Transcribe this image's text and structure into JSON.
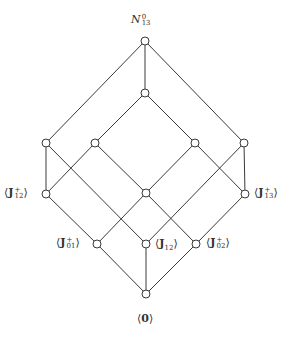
{
  "diagram": {
    "type": "lattice (Hasse diagram)",
    "nodes": [
      {
        "id": "top",
        "x": 145,
        "y": 41,
        "label": "N",
        "label_sub": "13",
        "label_sup": "0",
        "label_style": "calligraphic"
      },
      {
        "id": "n2",
        "x": 145,
        "y": 93,
        "label": ""
      },
      {
        "id": "l1",
        "x": 46,
        "y": 143,
        "label": ""
      },
      {
        "id": "l2",
        "x": 95,
        "y": 143,
        "label": ""
      },
      {
        "id": "r2",
        "x": 195,
        "y": 143,
        "label": ""
      },
      {
        "id": "r1",
        "x": 244,
        "y": 143,
        "label": ""
      },
      {
        "id": "J12p",
        "x": 46,
        "y": 194,
        "label": "J",
        "label_sub": "12",
        "label_sup": "+"
      },
      {
        "id": "mid",
        "x": 146,
        "y": 193,
        "label": ""
      },
      {
        "id": "J13p",
        "x": 245,
        "y": 194,
        "label": "J",
        "label_sub": "13",
        "label_sup": "+"
      },
      {
        "id": "J01p",
        "x": 97,
        "y": 244,
        "label": "J",
        "label_sub": "01",
        "label_sup": "+"
      },
      {
        "id": "J12",
        "x": 146,
        "y": 244,
        "label": "J",
        "label_sub": "12",
        "label_sup": ""
      },
      {
        "id": "J02p",
        "x": 196,
        "y": 244,
        "label": "J",
        "label_sub": "02",
        "label_sup": "+"
      },
      {
        "id": "zero",
        "x": 146,
        "y": 294,
        "label": "0"
      }
    ],
    "edges": [
      [
        "top",
        "l1"
      ],
      [
        "top",
        "n2"
      ],
      [
        "top",
        "r1"
      ],
      [
        "n2",
        "l2"
      ],
      [
        "n2",
        "r2"
      ],
      [
        "l1",
        "J12p"
      ],
      [
        "l1",
        "J12"
      ],
      [
        "l2",
        "J12p"
      ],
      [
        "l2",
        "mid"
      ],
      [
        "r2",
        "J13p"
      ],
      [
        "r2",
        "mid"
      ],
      [
        "r1",
        "J13p"
      ],
      [
        "r1",
        "J12"
      ],
      [
        "J12p",
        "J01p"
      ],
      [
        "mid",
        "J01p"
      ],
      [
        "mid",
        "J02p"
      ],
      [
        "J13p",
        "J02p"
      ],
      [
        "J01p",
        "zero"
      ],
      [
        "J12",
        "zero"
      ],
      [
        "J02p",
        "zero"
      ]
    ],
    "labels": {
      "top": {
        "text": "N",
        "sub": "13",
        "sup": "0"
      },
      "J12p": {
        "text": "J",
        "sub": "12",
        "sup": "+"
      },
      "J13p": {
        "text": "J",
        "sub": "13",
        "sup": "+"
      },
      "J01p": {
        "text": "J",
        "sub": "01",
        "sup": "+"
      },
      "J12": {
        "text": "J",
        "sub": "12"
      },
      "J02p": {
        "text": "J",
        "sub": "02",
        "sup": "+"
      },
      "zero": {
        "text": "0"
      }
    },
    "brackets": {
      "open": "⟨",
      "close": "⟩"
    },
    "colors": {
      "line": "#3a3a3a",
      "node_fill": "#ffffff",
      "text": "#333333"
    }
  }
}
